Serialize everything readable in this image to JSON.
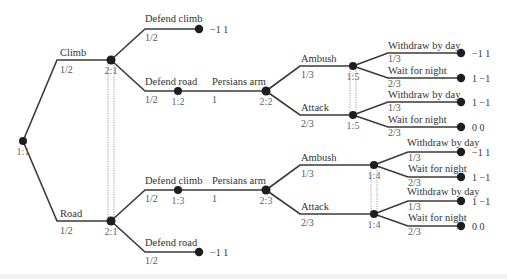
{
  "diagram": {
    "type": "game-tree",
    "colors": {
      "edge": "#3a3a3a",
      "node": "#1e1e1e",
      "chance_node": "#4a4a4a",
      "info_set": "#888888",
      "text": "#333333",
      "label_grey": "#666666"
    },
    "nodes": [
      {
        "id": "n_root",
        "label": "1:1",
        "x": 23,
        "y": 141,
        "r": 4
      },
      {
        "id": "n_2_1a",
        "label": "2:1",
        "x": 111,
        "y": 60,
        "r": 4.5
      },
      {
        "id": "n_2_1b",
        "label": "2:1",
        "x": 111,
        "y": 221,
        "r": 4.5
      },
      {
        "id": "n_1_2",
        "label": "1:2",
        "x": 178,
        "y": 91,
        "r": 4
      },
      {
        "id": "n_1_3",
        "label": "1:3",
        "x": 178,
        "y": 190,
        "r": 4
      },
      {
        "id": "n_2_2",
        "label": "2:2",
        "x": 266,
        "y": 91,
        "r": 4.5
      },
      {
        "id": "n_2_3",
        "label": "2:3",
        "x": 266,
        "y": 190,
        "r": 4.5
      },
      {
        "id": "n_1_5a",
        "label": "1:5",
        "x": 353,
        "y": 66,
        "r": 4
      },
      {
        "id": "n_1_5b",
        "label": "1:5",
        "x": 353,
        "y": 115,
        "r": 4
      },
      {
        "id": "n_1_4a",
        "label": "1:4",
        "x": 374,
        "y": 165,
        "r": 4
      },
      {
        "id": "n_1_4b",
        "label": "1:4",
        "x": 374,
        "y": 214,
        "r": 4
      }
    ],
    "terminals": [
      {
        "id": "t1",
        "x": 199,
        "y": 29,
        "payoff": "−1  1"
      },
      {
        "id": "t2",
        "x": 461,
        "y": 53,
        "payoff": "−1  1"
      },
      {
        "id": "t3",
        "x": 461,
        "y": 78,
        "payoff": "1  −1"
      },
      {
        "id": "t4",
        "x": 461,
        "y": 102,
        "payoff": "1  −1"
      },
      {
        "id": "t5",
        "x": 461,
        "y": 127,
        "payoff": "0  0"
      },
      {
        "id": "t6",
        "x": 461,
        "y": 152,
        "payoff": "−1  1"
      },
      {
        "id": "t7",
        "x": 461,
        "y": 177,
        "payoff": "1  −1"
      },
      {
        "id": "t8",
        "x": 461,
        "y": 201,
        "payoff": "1  −1"
      },
      {
        "id": "t9",
        "x": 461,
        "y": 226,
        "payoff": "0  0"
      },
      {
        "id": "t10",
        "x": 199,
        "y": 252,
        "payoff": "−1  1"
      }
    ],
    "edges": [
      {
        "label": "Climb",
        "prob": "1/2",
        "points": [
          [
            23,
            141
          ],
          [
            57,
            60
          ],
          [
            111,
            60
          ]
        ],
        "lx": 60,
        "ly": 56,
        "px": 60,
        "py": 73
      },
      {
        "label": "Road",
        "prob": "1/2",
        "points": [
          [
            23,
            141
          ],
          [
            57,
            221
          ],
          [
            111,
            221
          ]
        ],
        "lx": 60,
        "ly": 217,
        "px": 60,
        "py": 234
      },
      {
        "label": "Defend climb",
        "prob": "1/2",
        "points": [
          [
            111,
            60
          ],
          [
            145,
            29
          ],
          [
            199,
            29
          ]
        ],
        "lx": 145,
        "ly": 22,
        "px": 145,
        "py": 41
      },
      {
        "label": "Defend road",
        "prob": "1/2",
        "points": [
          [
            111,
            60
          ],
          [
            145,
            91
          ],
          [
            178,
            91
          ]
        ],
        "lx": 145,
        "ly": 85,
        "px": 145,
        "py": 103
      },
      {
        "label": "Persians arm",
        "prob": "1",
        "points": [
          [
            178,
            91
          ],
          [
            266,
            91
          ]
        ],
        "lx": 212,
        "ly": 85,
        "px": 212,
        "py": 103
      },
      {
        "label": "Ambush",
        "prob": "1/3",
        "points": [
          [
            266,
            91
          ],
          [
            300,
            66
          ],
          [
            353,
            66
          ]
        ],
        "lx": 301,
        "ly": 62,
        "px": 301,
        "py": 78
      },
      {
        "label": "Attack",
        "prob": "2/3",
        "points": [
          [
            266,
            91
          ],
          [
            300,
            115
          ],
          [
            353,
            115
          ]
        ],
        "lx": 301,
        "ly": 111,
        "px": 301,
        "py": 127
      },
      {
        "label": "Withdraw by day",
        "prob": "1/3",
        "points": [
          [
            353,
            66
          ],
          [
            388,
            53
          ],
          [
            461,
            53
          ]
        ],
        "lx": 388,
        "ly": 49,
        "px": 388,
        "py": 62
      },
      {
        "label": "Wait for night",
        "prob": "2/3",
        "points": [
          [
            353,
            66
          ],
          [
            388,
            78
          ],
          [
            461,
            78
          ]
        ],
        "lx": 388,
        "ly": 74,
        "px": 388,
        "py": 87
      },
      {
        "label": "Withdraw by day",
        "prob": "1/3",
        "points": [
          [
            353,
            115
          ],
          [
            388,
            102
          ],
          [
            461,
            102
          ]
        ],
        "lx": 388,
        "ly": 98,
        "px": 388,
        "py": 111
      },
      {
        "label": "Wait for night",
        "prob": "2/3",
        "points": [
          [
            353,
            115
          ],
          [
            388,
            127
          ],
          [
            461,
            127
          ]
        ],
        "lx": 388,
        "ly": 123,
        "px": 388,
        "py": 136
      },
      {
        "label": "Defend climb",
        "prob": "1/2",
        "points": [
          [
            111,
            221
          ],
          [
            145,
            190
          ],
          [
            178,
            190
          ]
        ],
        "lx": 145,
        "ly": 184,
        "px": 145,
        "py": 202
      },
      {
        "label": "Defend road",
        "prob": "1/2",
        "points": [
          [
            111,
            221
          ],
          [
            145,
            252
          ],
          [
            199,
            252
          ]
        ],
        "lx": 145,
        "ly": 246,
        "px": 145,
        "py": 264
      },
      {
        "label": "Persians arm",
        "prob": "1",
        "points": [
          [
            178,
            190
          ],
          [
            266,
            190
          ]
        ],
        "lx": 212,
        "ly": 184,
        "px": 212,
        "py": 202
      },
      {
        "label": "Ambush",
        "prob": "1/3",
        "points": [
          [
            266,
            190
          ],
          [
            300,
            165
          ],
          [
            374,
            165
          ]
        ],
        "lx": 301,
        "ly": 161,
        "px": 301,
        "py": 177
      },
      {
        "label": "Attack",
        "prob": "2/3",
        "points": [
          [
            266,
            190
          ],
          [
            300,
            214
          ],
          [
            374,
            214
          ]
        ],
        "lx": 301,
        "ly": 210,
        "px": 301,
        "py": 226
      },
      {
        "label": "Withdraw by day",
        "prob": "1/3",
        "points": [
          [
            374,
            165
          ],
          [
            408,
            152
          ],
          [
            461,
            152
          ]
        ],
        "lx": 407,
        "ly": 146,
        "px": 408,
        "py": 161
      },
      {
        "label": "Wait for night",
        "prob": "2/3",
        "points": [
          [
            374,
            165
          ],
          [
            408,
            177
          ],
          [
            461,
            177
          ]
        ],
        "lx": 408,
        "ly": 172,
        "px": 408,
        "py": 186
      },
      {
        "label": "Withdraw by day",
        "prob": "1/3",
        "points": [
          [
            374,
            214
          ],
          [
            408,
            201
          ],
          [
            461,
            201
          ]
        ],
        "lx": 407,
        "ly": 195,
        "px": 408,
        "py": 210
      },
      {
        "label": "Wait for night",
        "prob": "2/3",
        "points": [
          [
            374,
            214
          ],
          [
            408,
            226
          ],
          [
            461,
            226
          ]
        ],
        "lx": 408,
        "ly": 221,
        "px": 408,
        "py": 235
      }
    ],
    "info_sets": [
      {
        "label": "player 2 info set",
        "x1": 108,
        "x2": 114,
        "y1": 60,
        "y2": 221
      },
      {
        "label": "player 1 info set 1:5",
        "x1": 350,
        "x2": 356,
        "y1": 66,
        "y2": 115
      },
      {
        "label": "player 1 info set 1:4",
        "x1": 371,
        "x2": 377,
        "y1": 165,
        "y2": 214
      }
    ]
  }
}
